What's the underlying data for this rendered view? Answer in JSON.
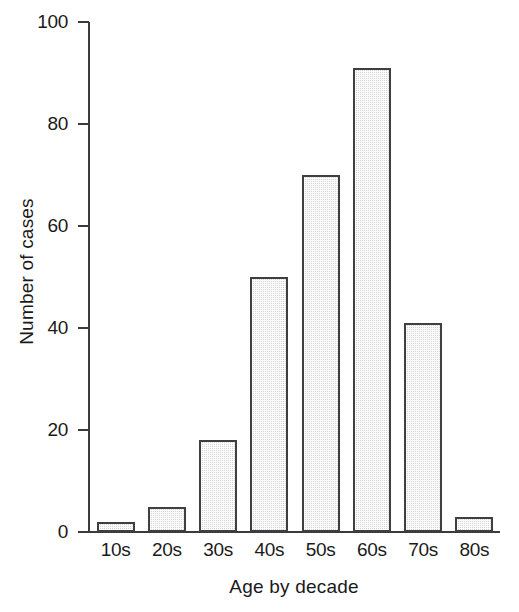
{
  "chart_data": {
    "type": "bar",
    "title": "",
    "xlabel": "Age by decade",
    "ylabel": "Number of cases",
    "categories": [
      "10s",
      "20s",
      "30s",
      "40s",
      "50s",
      "60s",
      "70s",
      "80s"
    ],
    "values": [
      2,
      5,
      18,
      50,
      70,
      91,
      41,
      3
    ],
    "ylim": [
      0,
      100
    ],
    "yticks": [
      0,
      20,
      40,
      60,
      80,
      100
    ],
    "grid": false,
    "legend": null,
    "bar_fill_color": "#d7d7d7",
    "bar_edge_color": "#3f3f3f",
    "axis_color": "#3a3a3a"
  }
}
